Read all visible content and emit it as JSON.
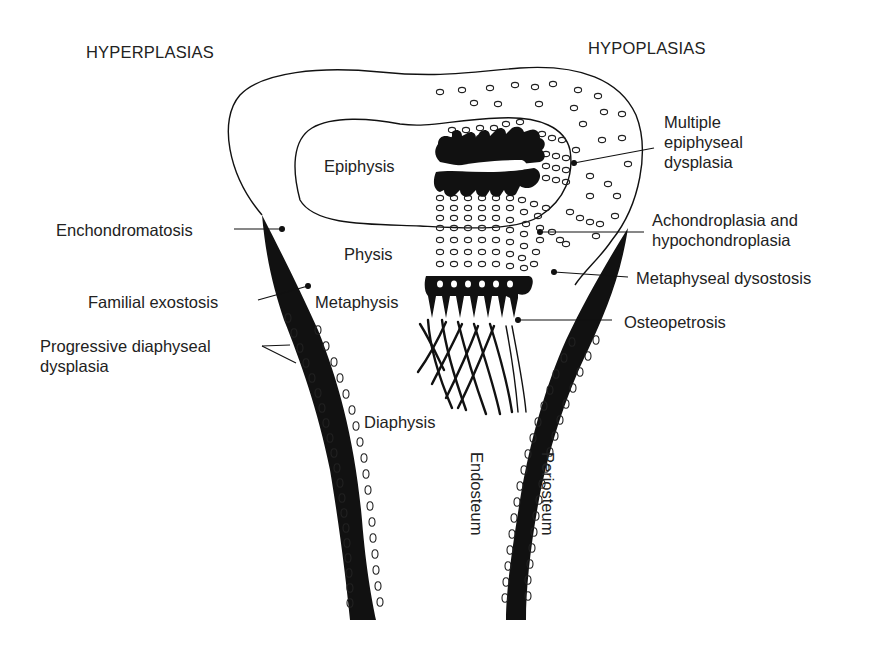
{
  "diagram": {
    "headers": {
      "left": "HYPERPLASIAS",
      "right": "HYPOPLASIAS"
    },
    "regions": {
      "epiphysis": "Epiphysis",
      "physis": "Physis",
      "metaphysis": "Metaphysis",
      "diaphysis": "Diaphysis",
      "endosteum": "Endosteum",
      "periosteum": "Periosteum"
    },
    "left_labels": [
      {
        "id": "enchondromatosis",
        "text": "Enchondromatosis"
      },
      {
        "id": "familial-exostosis",
        "text": "Familial exostosis"
      },
      {
        "id": "progressive-diaphyseal-dysplasia",
        "text": "Progressive diaphyseal\ndysplasia"
      }
    ],
    "right_labels": [
      {
        "id": "multiple-epiphyseal-dysplasia",
        "text": "Multiple\nepiphyseal\ndysplasia"
      },
      {
        "id": "achondroplasia",
        "text": "Achondroplasia and\nhypochondroplasia"
      },
      {
        "id": "metaphyseal-dysostosis",
        "text": "Metaphyseal dysostosis"
      },
      {
        "id": "osteopetrosis",
        "text": "Osteopetrosis"
      }
    ],
    "colors": {
      "ink": "#111111",
      "background": "#ffffff",
      "text": "#222222"
    }
  }
}
